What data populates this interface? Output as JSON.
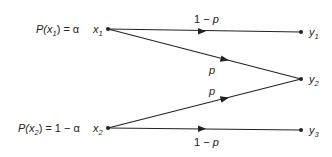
{
  "diagram": {
    "type": "binary-erasure-like channel transition diagram",
    "inputs": [
      {
        "id": "x1",
        "name": "x",
        "sub": "1",
        "prob_label_prefix": "P(x",
        "prob_label_sub": "1",
        "prob_label_suffix": ") = α"
      },
      {
        "id": "x2",
        "name": "x",
        "sub": "2",
        "prob_label_prefix": "P(x",
        "prob_label_sub": "2",
        "prob_label_suffix": ") = 1 − α"
      }
    ],
    "outputs": [
      {
        "id": "y1",
        "name": "y",
        "sub": "1"
      },
      {
        "id": "y2",
        "name": "y",
        "sub": "2"
      },
      {
        "id": "y3",
        "name": "y",
        "sub": "3"
      }
    ],
    "edges": [
      {
        "from": "x1",
        "to": "y1",
        "label": "1 − p"
      },
      {
        "from": "x1",
        "to": "y2",
        "label": "p"
      },
      {
        "from": "x2",
        "to": "y2",
        "label": "p"
      },
      {
        "from": "x2",
        "to": "y3",
        "label": "1 − p"
      }
    ],
    "colors": {
      "line": "#222222",
      "background": "#ffffff"
    }
  }
}
